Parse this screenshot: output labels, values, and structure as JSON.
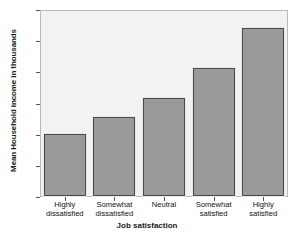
{
  "chart_data": {
    "type": "bar",
    "title": "",
    "xlabel": "Job satisfaction",
    "ylabel": "Mean Household income in thousands",
    "categories": [
      "Highly dissatisfied",
      "Somewhat dissatisfied",
      "Neutral",
      "Somewhat satisfied",
      "Highly satisfied"
    ],
    "category_lines": [
      [
        "Highly",
        "dissatisfied"
      ],
      [
        "Somewhat",
        "dissatisfied"
      ],
      [
        "Neutral",
        ""
      ],
      [
        "Somewhat",
        "satisfied"
      ],
      [
        "Highly",
        "satisfied"
      ]
    ],
    "values": [
      40,
      51,
      63,
      82,
      108
    ],
    "ylim": [
      0,
      120
    ],
    "yticks": [
      0,
      20,
      40,
      60,
      80,
      100,
      120
    ],
    "ytick_labels": [
      "0",
      "20",
      "40",
      "60",
      "80",
      "100",
      "120"
    ],
    "grid": false,
    "legend": "none",
    "colors": {
      "bar_fill": "#9a9a9a",
      "bar_border": "#4a4a4a",
      "plot_background": "#f2f2f2",
      "frame": "#b9b9b9",
      "text": "#111111",
      "page_background": "#ffffff"
    }
  }
}
